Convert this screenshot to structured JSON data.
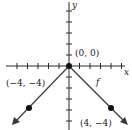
{
  "figure": {
    "type": "function-graph",
    "function_label": "f",
    "axes": {
      "x_label": "x",
      "y_label": "y"
    },
    "points": [
      {
        "label": "(0, 0)",
        "x": 0,
        "y": 0
      },
      {
        "label": "(−4, −4)",
        "x": -4,
        "y": -4
      },
      {
        "label": "(4, −4)",
        "x": 4,
        "y": -4
      }
    ],
    "colors": {
      "axis": "#2a2a2a",
      "line": "#3a3a3a",
      "point": "#111111"
    }
  }
}
